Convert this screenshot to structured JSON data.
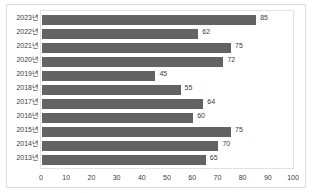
{
  "chart_data": {
    "type": "bar",
    "orientation": "horizontal",
    "title": "",
    "xlabel": "",
    "ylabel": "",
    "categories": [
      "2023년",
      "2022년",
      "2021년",
      "2020년",
      "2019년",
      "2018년",
      "2017년",
      "2016년",
      "2015년",
      "2014년",
      "2013년"
    ],
    "values": [
      85,
      62,
      75,
      72,
      45,
      55,
      64,
      60,
      75,
      70,
      65
    ],
    "xlim": [
      0,
      100
    ],
    "xticks": [
      0,
      10,
      20,
      30,
      40,
      50,
      60,
      70,
      80,
      90,
      100
    ],
    "xtick_labels": [
      "0",
      "10",
      "20",
      "30",
      "40",
      "50",
      "60",
      "70",
      "80",
      "90",
      "100"
    ],
    "grid": false,
    "legend": false,
    "data_labels": true,
    "bar_color": "#636363",
    "frame_color": "#dcdcdc",
    "plot_border_color": "#e2e2e2",
    "text_color": "#3b3b3b"
  }
}
